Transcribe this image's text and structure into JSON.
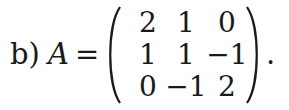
{
  "expression": {
    "label": "b)",
    "variable": "A",
    "equals": "=",
    "period": "."
  },
  "matrix": {
    "rows": [
      [
        "2",
        "1",
        "0"
      ],
      [
        "1",
        "1",
        "−1"
      ],
      [
        "0",
        "−1",
        "2"
      ]
    ]
  }
}
